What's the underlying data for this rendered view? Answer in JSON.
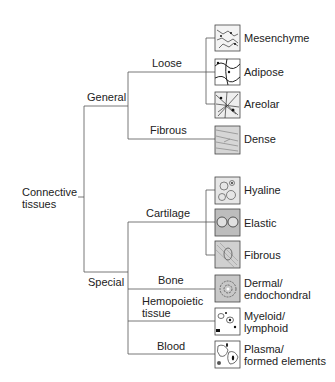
{
  "root": {
    "label_line1": "Connective",
    "label_line2": "tissues"
  },
  "branches": [
    {
      "label": "General",
      "subgroups": [
        {
          "label": "Loose",
          "leaves": [
            "Mesenchyme",
            "Adipose",
            "Areolar"
          ]
        },
        {
          "label": "Fibrous",
          "leaves": [
            "Dense"
          ]
        }
      ]
    },
    {
      "label": "Special",
      "subgroups": [
        {
          "label": "Cartilage",
          "leaves": [
            "Hyaline",
            "Elastic",
            "Fibrous"
          ]
        },
        {
          "label": "Bone",
          "leaves": [
            "Dermal/ endochondral"
          ]
        },
        {
          "label": "Hemopoietic tissue",
          "leaves": [
            "Myeloid/ lymphoid"
          ]
        },
        {
          "label": "Blood",
          "leaves": [
            "Plasma/ formed elements"
          ]
        }
      ]
    }
  ],
  "labels": {
    "general": "General",
    "special": "Special",
    "loose": "Loose",
    "fibrous_group": "Fibrous",
    "cartilage": "Cartilage",
    "bone": "Bone",
    "hemopoietic_1": "Hemopoietic",
    "hemopoietic_2": "tissue",
    "blood": "Blood",
    "mesenchyme": "Mesenchyme",
    "adipose": "Adipose",
    "areolar": "Areolar",
    "dense": "Dense",
    "hyaline": "Hyaline",
    "elastic": "Elastic",
    "fibrous_leaf": "Fibrous",
    "dermal_1": "Dermal/",
    "dermal_2": "endochondral",
    "myeloid_1": "Myeloid/",
    "myeloid_2": "lymphoid",
    "plasma_1": "Plasma/",
    "plasma_2": "formed elements"
  },
  "icons": [
    "mesenchyme-tissue-icon",
    "adipose-tissue-icon",
    "areolar-tissue-icon",
    "dense-tissue-icon",
    "hyaline-cartilage-icon",
    "elastic-cartilage-icon",
    "fibrous-cartilage-icon",
    "bone-tissue-icon",
    "hemopoietic-tissue-icon",
    "blood-tissue-icon"
  ]
}
